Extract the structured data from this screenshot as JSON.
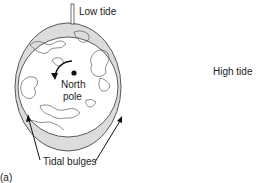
{
  "diagram": {
    "labels": {
      "low_tide": "Low tide",
      "high_tide": "High tide",
      "north": "North",
      "pole": "pole",
      "tidal_bulges": "Tidal bulges",
      "panel": "(a)"
    },
    "colors": {
      "ink": "#222222",
      "bulge_fill": "#d9d9d9",
      "background": "#ffffff"
    }
  }
}
